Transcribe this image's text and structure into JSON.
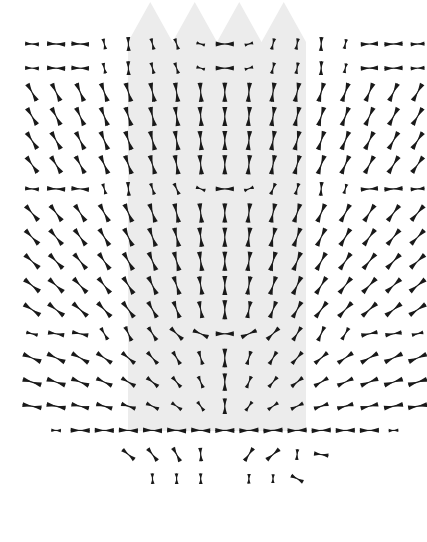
{
  "figure": {
    "title": "Tensor field glyph plot",
    "width": 427,
    "height": 542,
    "background_color": "#ffffff",
    "glyph_color": "#1a1a1a",
    "region_fill_color": "#ececec"
  },
  "highlight_region": {
    "name": "shaded-band",
    "fill": "#ececec",
    "left": 128,
    "right": 306,
    "top": 2,
    "bottom": 431,
    "peak_count": 4,
    "peak_height": 40,
    "peak_baseline_y": 42,
    "description": "Light gray vertical band with four triangular peaks along its top edge"
  },
  "grid": {
    "x_origin": 32,
    "y_origin": 44,
    "x_spacing": 24.1,
    "y_spacing": 24.15,
    "columns": 16,
    "rows": 19,
    "glyph_base_length": 19,
    "glyph_base_thickness": 5
  },
  "chart_data": {
    "type": "scatter",
    "title": "Tensor field glyph plot",
    "subtitle": "Bowtie eigenvector glyphs on a regular lattice",
    "xlabel": "",
    "ylabel": "",
    "xlim": [
      0,
      427
    ],
    "ylim": [
      542,
      0
    ],
    "grid": false,
    "legend": "none",
    "glyph_shape": "bowtie",
    "columns": 16,
    "rows": 19,
    "annotations": [
      "Shaded band with four triangular peaks spans columns 5 through 12",
      "Glyph orientation rotates radially about a source near column 8, row 16",
      "Lower three rows taper to a narrow fan of short glyphs"
    ],
    "field_model": {
      "center_col": 8.0,
      "center_row": 16.4,
      "swirl": 0.0,
      "base_angle_deg": 0.0,
      "description": "Orientation angle at each node equals the bearing from the field center; magnitude decays with distance from the center and is clipped outside a radial mask."
    },
    "points": [
      {
        "row": 0,
        "cells": [
          {
            "col": 0,
            "angle": 3,
            "len": 0.72
          },
          {
            "col": 1,
            "angle": 2,
            "len": 0.95
          },
          {
            "col": 2,
            "angle": 2,
            "len": 0.92
          },
          {
            "col": 3,
            "angle": 78,
            "len": 0.55
          },
          {
            "col": 4,
            "angle": 88,
            "len": 0.72
          },
          {
            "col": 5,
            "angle": 76,
            "len": 0.58
          },
          {
            "col": 6,
            "angle": 72,
            "len": 0.58
          },
          {
            "col": 7,
            "angle": 16,
            "len": 0.44
          },
          {
            "col": 8,
            "angle": 0,
            "len": 0.95
          },
          {
            "col": 9,
            "angle": -16,
            "len": 0.44
          },
          {
            "col": 10,
            "angle": -76,
            "len": 0.58
          },
          {
            "col": 11,
            "angle": -80,
            "len": 0.58
          },
          {
            "col": 12,
            "angle": -88,
            "len": 0.72
          },
          {
            "col": 13,
            "angle": -78,
            "len": 0.5
          },
          {
            "col": 14,
            "angle": -2,
            "len": 0.9
          },
          {
            "col": 15,
            "angle": -2,
            "len": 0.95
          },
          {
            "col": 16,
            "angle": -3,
            "len": 0.72
          }
        ]
      },
      {
        "row": 1,
        "cells": [
          {
            "col": 0,
            "angle": 3,
            "len": 0.72
          },
          {
            "col": 1,
            "angle": 2,
            "len": 0.95
          },
          {
            "col": 2,
            "angle": 2,
            "len": 0.92
          },
          {
            "col": 3,
            "angle": 78,
            "len": 0.55
          },
          {
            "col": 4,
            "angle": 88,
            "len": 0.72
          },
          {
            "col": 5,
            "angle": 76,
            "len": 0.58
          },
          {
            "col": 6,
            "angle": 72,
            "len": 0.58
          },
          {
            "col": 7,
            "angle": 16,
            "len": 0.44
          },
          {
            "col": 8,
            "angle": 0,
            "len": 0.95
          },
          {
            "col": 9,
            "angle": -16,
            "len": 0.44
          },
          {
            "col": 10,
            "angle": -76,
            "len": 0.58
          },
          {
            "col": 11,
            "angle": -80,
            "len": 0.58
          },
          {
            "col": 12,
            "angle": -88,
            "len": 0.72
          },
          {
            "col": 13,
            "angle": -78,
            "len": 0.5
          },
          {
            "col": 14,
            "angle": -2,
            "len": 0.9
          },
          {
            "col": 15,
            "angle": -2,
            "len": 0.95
          },
          {
            "col": 16,
            "angle": -3,
            "len": 0.72
          }
        ]
      },
      {
        "row": 6,
        "cells": [
          {
            "col": 0,
            "angle": 4,
            "len": 0.72
          },
          {
            "col": 1,
            "angle": 3,
            "len": 0.95
          },
          {
            "col": 2,
            "angle": 4,
            "len": 0.92
          },
          {
            "col": 3,
            "angle": 74,
            "len": 0.55
          },
          {
            "col": 4,
            "angle": 86,
            "len": 0.72
          },
          {
            "col": 5,
            "angle": 72,
            "len": 0.6
          },
          {
            "col": 6,
            "angle": 66,
            "len": 0.62
          },
          {
            "col": 7,
            "angle": 20,
            "len": 0.5
          },
          {
            "col": 8,
            "angle": 0,
            "len": 0.95
          },
          {
            "col": 9,
            "angle": -20,
            "len": 0.5
          },
          {
            "col": 10,
            "angle": -68,
            "len": 0.62
          },
          {
            "col": 11,
            "angle": -74,
            "len": 0.6
          },
          {
            "col": 12,
            "angle": -86,
            "len": 0.72
          },
          {
            "col": 13,
            "angle": -74,
            "len": 0.5
          },
          {
            "col": 14,
            "angle": -4,
            "len": 0.9
          },
          {
            "col": 15,
            "angle": -3,
            "len": 0.95
          },
          {
            "col": 16,
            "angle": -4,
            "len": 0.72
          }
        ]
      },
      {
        "row": 12,
        "cells": [
          {
            "col": 0,
            "angle": 14,
            "len": 0.6
          },
          {
            "col": 1,
            "angle": 10,
            "len": 0.85
          },
          {
            "col": 2,
            "angle": 12,
            "len": 0.85
          },
          {
            "col": 3,
            "angle": 60,
            "len": 0.7
          },
          {
            "col": 4,
            "angle": 66,
            "len": 0.8
          },
          {
            "col": 5,
            "angle": 58,
            "len": 0.8
          },
          {
            "col": 6,
            "angle": 44,
            "len": 0.85
          },
          {
            "col": 7,
            "angle": 24,
            "len": 0.85
          },
          {
            "col": 8,
            "angle": 0,
            "len": 0.95
          },
          {
            "col": 9,
            "angle": -24,
            "len": 0.85
          },
          {
            "col": 10,
            "angle": -44,
            "len": 0.85
          },
          {
            "col": 11,
            "angle": -58,
            "len": 0.8
          },
          {
            "col": 12,
            "angle": -66,
            "len": 0.8
          },
          {
            "col": 13,
            "angle": -60,
            "len": 0.7
          },
          {
            "col": 14,
            "angle": -12,
            "len": 0.85
          },
          {
            "col": 15,
            "angle": -10,
            "len": 0.85
          },
          {
            "col": 16,
            "angle": -14,
            "len": 0.6
          }
        ]
      },
      {
        "row": 16,
        "cells": [
          {
            "col": 1,
            "angle": 2,
            "len": 0.5
          },
          {
            "col": 2,
            "angle": 1,
            "len": 1.0
          },
          {
            "col": 3,
            "angle": 1,
            "len": 1.0
          },
          {
            "col": 4,
            "angle": 2,
            "len": 1.0
          },
          {
            "col": 5,
            "angle": 2,
            "len": 1.0
          },
          {
            "col": 6,
            "angle": 3,
            "len": 1.0
          },
          {
            "col": 7,
            "angle": 2,
            "len": 1.0
          },
          {
            "col": 8,
            "angle": 0,
            "len": 1.0
          },
          {
            "col": 9,
            "angle": -2,
            "len": 1.0
          },
          {
            "col": 10,
            "angle": -3,
            "len": 1.0
          },
          {
            "col": 11,
            "angle": -2,
            "len": 1.0
          },
          {
            "col": 12,
            "angle": -2,
            "len": 1.0
          },
          {
            "col": 13,
            "angle": -1,
            "len": 1.0
          },
          {
            "col": 14,
            "angle": -1,
            "len": 1.0
          },
          {
            "col": 15,
            "angle": -2,
            "len": 0.5
          }
        ]
      },
      {
        "row": 17,
        "cells": [
          {
            "col": 3,
            "angle": 84,
            "len": 0.55
          },
          {
            "col": 4,
            "angle": 40,
            "len": 0.8
          },
          {
            "col": 5,
            "angle": 52,
            "len": 0.8
          },
          {
            "col": 6,
            "angle": 62,
            "len": 0.8
          },
          {
            "col": 7,
            "angle": 86,
            "len": 0.7
          },
          {
            "col": 8,
            "angle": -66,
            "len": 0.8
          },
          {
            "col": 9,
            "angle": -56,
            "len": 0.8
          },
          {
            "col": 10,
            "angle": -40,
            "len": 0.85
          },
          {
            "col": 11,
            "angle": -86,
            "len": 0.55
          }
        ]
      },
      {
        "row": 18,
        "cells": [
          {
            "col": 3,
            "angle": 88,
            "len": 0.45
          },
          {
            "col": 4,
            "angle": 88,
            "len": 0.5
          },
          {
            "col": 5,
            "angle": 88,
            "len": 0.55
          },
          {
            "col": 6,
            "angle": 89,
            "len": 0.55
          },
          {
            "col": 7,
            "angle": 89,
            "len": 0.55
          },
          {
            "col": 8,
            "angle": -89,
            "len": 0.55
          },
          {
            "col": 9,
            "angle": -88,
            "len": 0.5
          },
          {
            "col": 10,
            "angle": -88,
            "len": 0.45
          }
        ]
      }
    ]
  }
}
